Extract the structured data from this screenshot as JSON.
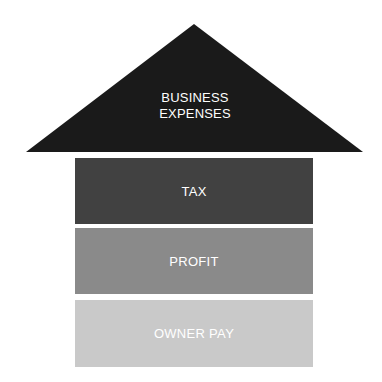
{
  "diagram": {
    "type": "house-stack",
    "roof": {
      "label_line1": "BUSINESS",
      "label_line2": "EXPENSES",
      "color": "#1a1a1a"
    },
    "blocks": [
      {
        "label": "TAX",
        "color": "#414141"
      },
      {
        "label": "PROFIT",
        "color": "#8a8a8a"
      },
      {
        "label": "OWNER PAY",
        "color": "#c9c9c9"
      }
    ]
  }
}
